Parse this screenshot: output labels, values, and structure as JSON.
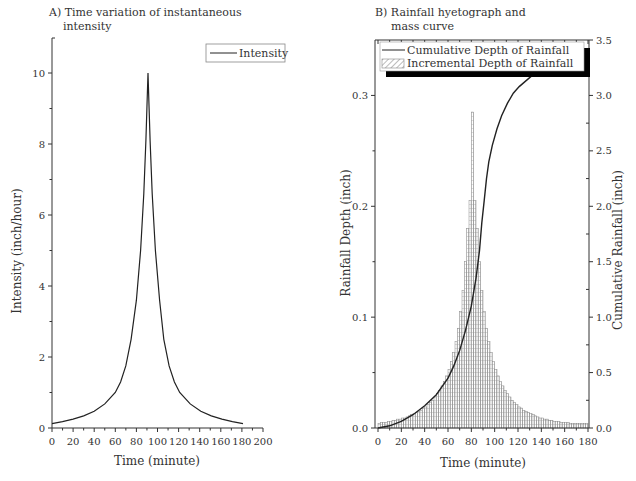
{
  "chart_data": [
    {
      "type": "line",
      "title": "A) Time variation of instantaneous intensity",
      "title_lines": [
        "A) Time variation of instantaneous",
        "intensity"
      ],
      "xlabel": "Time (minute)",
      "ylabel": "Intensity (inch/hour)",
      "xlim": [
        0,
        200
      ],
      "ylim": [
        0,
        11
      ],
      "xticks": [
        0,
        20,
        40,
        60,
        80,
        100,
        120,
        140,
        160,
        180,
        200
      ],
      "yticks": [
        0,
        2,
        4,
        6,
        8,
        10
      ],
      "grid": false,
      "legend": {
        "position": "upper right",
        "entries": [
          "Intensity"
        ]
      },
      "series": [
        {
          "name": "Intensity",
          "x": [
            0,
            10,
            20,
            30,
            40,
            50,
            60,
            65,
            70,
            75,
            80,
            84,
            87,
            89,
            90,
            91,
            92,
            93,
            95,
            98,
            102,
            106,
            111,
            116,
            121,
            131,
            141,
            151,
            161,
            171,
            181
          ],
          "values": [
            0.12,
            0.18,
            0.25,
            0.34,
            0.47,
            0.68,
            1.0,
            1.3,
            1.75,
            2.5,
            3.6,
            5.0,
            6.6,
            8.1,
            9.0,
            10.0,
            9.0,
            8.1,
            6.6,
            5.0,
            3.6,
            2.5,
            1.75,
            1.3,
            1.0,
            0.68,
            0.47,
            0.34,
            0.25,
            0.18,
            0.12
          ]
        }
      ]
    },
    {
      "type": "bar",
      "title": "B) Rainfall hyetograph and mass curve",
      "title_lines": [
        "B)  Rainfall hyetograph and",
        "mass curve"
      ],
      "xlabel": "Time (minute)",
      "ylabel": "Rainfall Depth (inch)",
      "ylabel_right": "Cumulative Rainfall (inch)",
      "xlim": [
        0,
        180
      ],
      "ylim": [
        0,
        0.35
      ],
      "ylim_right": [
        0,
        3.5
      ],
      "xticks": [
        0,
        20,
        40,
        60,
        80,
        100,
        120,
        140,
        160,
        180
      ],
      "yticks": [
        0.0,
        0.1,
        0.2,
        0.3
      ],
      "yticks_right": [
        0.0,
        0.5,
        1.0,
        1.5,
        2.0,
        2.5,
        3.0,
        3.5
      ],
      "grid": false,
      "legend": {
        "position": "upper left",
        "entries": [
          "Cumulative Depth of Rainfall",
          "Incremental Depth of Rainfall"
        ]
      },
      "bar_width_minutes": 2,
      "series": [
        {
          "name": "Incremental Depth of Rainfall",
          "axis": "left",
          "type": "bar",
          "x": [
            1,
            3,
            5,
            7,
            9,
            11,
            13,
            15,
            17,
            19,
            21,
            23,
            25,
            27,
            29,
            31,
            33,
            35,
            37,
            39,
            41,
            43,
            45,
            47,
            49,
            51,
            53,
            55,
            57,
            59,
            61,
            63,
            65,
            67,
            69,
            71,
            73,
            75,
            77,
            79,
            81,
            83,
            85,
            87,
            89,
            91,
            93,
            95,
            97,
            99,
            101,
            103,
            105,
            107,
            109,
            111,
            113,
            115,
            117,
            119,
            121,
            123,
            125,
            127,
            129,
            131,
            133,
            135,
            137,
            139,
            141,
            143,
            145,
            147,
            149,
            151,
            153,
            155,
            157,
            159,
            161,
            163,
            165,
            167,
            169,
            171,
            173,
            175,
            177,
            179
          ],
          "values": [
            0.004,
            0.005,
            0.005,
            0.005,
            0.006,
            0.006,
            0.007,
            0.007,
            0.008,
            0.008,
            0.009,
            0.009,
            0.01,
            0.011,
            0.012,
            0.013,
            0.014,
            0.015,
            0.016,
            0.018,
            0.019,
            0.021,
            0.023,
            0.025,
            0.028,
            0.031,
            0.034,
            0.038,
            0.042,
            0.047,
            0.053,
            0.06,
            0.068,
            0.078,
            0.09,
            0.105,
            0.124,
            0.15,
            0.18,
            0.205,
            0.285,
            0.205,
            0.18,
            0.15,
            0.124,
            0.105,
            0.09,
            0.078,
            0.068,
            0.06,
            0.053,
            0.047,
            0.042,
            0.038,
            0.034,
            0.031,
            0.028,
            0.025,
            0.023,
            0.021,
            0.019,
            0.018,
            0.016,
            0.015,
            0.014,
            0.013,
            0.012,
            0.011,
            0.01,
            0.009,
            0.009,
            0.008,
            0.008,
            0.007,
            0.007,
            0.006,
            0.006,
            0.006,
            0.005,
            0.005,
            0.005,
            0.005,
            0.004,
            0.004,
            0.004,
            0.004,
            0.004,
            0.004,
            0.004,
            0.004
          ]
        },
        {
          "name": "Cumulative Depth of Rainfall",
          "axis": "right",
          "type": "line",
          "x": [
            0,
            10,
            20,
            30,
            40,
            50,
            60,
            65,
            70,
            75,
            80,
            84,
            87,
            89,
            91,
            93,
            95,
            98,
            102,
            106,
            111,
            116,
            121,
            131,
            141,
            151,
            161,
            171,
            180
          ],
          "values": [
            0.0,
            0.02,
            0.06,
            0.12,
            0.2,
            0.3,
            0.45,
            0.56,
            0.7,
            0.88,
            1.1,
            1.35,
            1.6,
            1.85,
            2.05,
            2.25,
            2.4,
            2.55,
            2.7,
            2.82,
            2.93,
            3.02,
            3.08,
            3.17,
            3.23,
            3.28,
            3.32,
            3.35,
            3.37
          ]
        }
      ]
    }
  ]
}
